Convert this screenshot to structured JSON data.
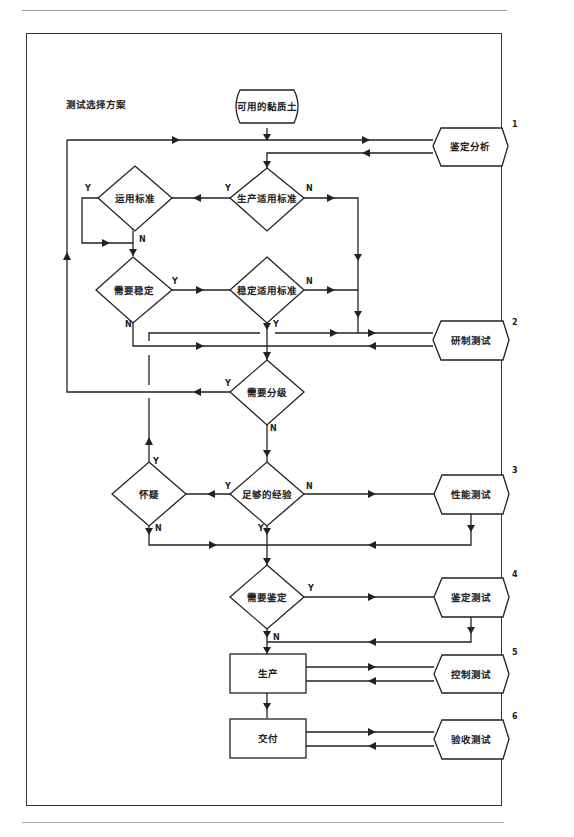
{
  "title": "测试选择方案",
  "start": {
    "label": "可用的黏质土"
  },
  "decisions": [
    {
      "id": "prod_std",
      "label": "生产适用标准"
    },
    {
      "id": "use_std",
      "label": "运用标准"
    },
    {
      "id": "need_stab",
      "label": "需要稳定"
    },
    {
      "id": "stab_std",
      "label": "稳定适用标准"
    },
    {
      "id": "need_grade",
      "label": "需要分级"
    },
    {
      "id": "enough_exp",
      "label": "足够的经验"
    },
    {
      "id": "doubt",
      "label": "怀疑"
    },
    {
      "id": "need_ident",
      "label": "需要鉴定"
    }
  ],
  "processes": [
    {
      "id": "production",
      "label": "生产"
    },
    {
      "id": "delivery",
      "label": "交付"
    }
  ],
  "tests": [
    {
      "num": "1",
      "label": "鉴定分析"
    },
    {
      "num": "2",
      "label": "研制测试"
    },
    {
      "num": "3",
      "label": "性能测试"
    },
    {
      "num": "4",
      "label": "鉴定测试"
    },
    {
      "num": "5",
      "label": "控制测试"
    },
    {
      "num": "6",
      "label": "验收测试"
    }
  ],
  "branch": {
    "yes": "Y",
    "no": "N"
  }
}
